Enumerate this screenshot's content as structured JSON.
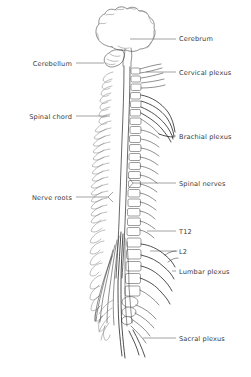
{
  "figure": {
    "type": "anatomical-line-diagram",
    "view": "lateral",
    "background_color": "#ffffff",
    "ink_color": "#4a4a4a",
    "label_color": "#3a3a3a",
    "leader_color": "#555555"
  },
  "labels": {
    "cerebrum": {
      "text": "Cerebrum",
      "side": "right",
      "x": 179,
      "y": 41,
      "leader": [
        130,
        39,
        176,
        39
      ]
    },
    "cervical_plexus": {
      "text": "Cervical plexus",
      "side": "right",
      "x": 179,
      "y": 75,
      "leader": [
        146,
        72,
        176,
        72
      ]
    },
    "brachial_plexus": {
      "text": "Brachial plexus",
      "side": "right",
      "x": 179,
      "y": 139,
      "leader": [
        172,
        136,
        176,
        136
      ]
    },
    "spinal_nerves": {
      "text": "Spinal nerves",
      "side": "right",
      "x": 179,
      "y": 186,
      "leader": [
        133,
        183,
        176,
        183
      ]
    },
    "t12": {
      "text": "T12",
      "side": "right",
      "x": 179,
      "y": 234,
      "leader": [
        147,
        231,
        176,
        231
      ]
    },
    "l2": {
      "text": "L2",
      "side": "right",
      "x": 179,
      "y": 254,
      "leader": [
        150,
        251,
        176,
        251
      ]
    },
    "lumbar_plexus": {
      "text": "Lumbar plexus",
      "side": "right",
      "x": 179,
      "y": 274,
      "leader": [
        172,
        271,
        176,
        271
      ]
    },
    "sacral_plexus": {
      "text": "Sacral plexus",
      "side": "right",
      "x": 179,
      "y": 341,
      "leader": [
        143,
        338,
        176,
        338
      ]
    },
    "cerebellum": {
      "text": "Cerebellum",
      "side": "left",
      "x": 72,
      "y": 66,
      "leader": [
        76,
        63,
        104,
        63
      ]
    },
    "spinal_chord": {
      "text": "Spinal chord",
      "side": "left",
      "x": 72,
      "y": 119,
      "leader": [
        76,
        116,
        110,
        116
      ]
    },
    "nerve_roots": {
      "text": "Nerve roots",
      "side": "left",
      "x": 72,
      "y": 200,
      "leader": [
        76,
        197,
        108,
        197
      ]
    }
  },
  "regions": {
    "brain": "cerebrum",
    "cerebellum": "cerebellum",
    "cervical": "cervical vertebrae",
    "thoracic": "thoracic vertebrae",
    "lumbar": "lumbar vertebrae",
    "sacral": "sacrum and cauda equina"
  }
}
